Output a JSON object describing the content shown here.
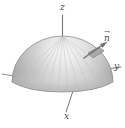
{
  "figure": {
    "name": "hemisphere-normal-vector-diagram",
    "background_color": "#ffffff"
  },
  "axes": {
    "z": {
      "label": "z",
      "description": "vertical axis rising from the apex of the dome"
    },
    "y": {
      "label": "y",
      "description": "axis extending to the right from the rim of the dome"
    },
    "x": {
      "label": "x",
      "description": "axis extending down and to the left toward the viewer"
    }
  },
  "annotations": {
    "normal_vector": {
      "label": "n",
      "accent": "→",
      "description": "outward unit normal vector arrow on a small surface patch of the upper right of the dome"
    }
  },
  "colors": {
    "background": "#ffffff",
    "surface_light": "#f2f2f2",
    "surface_mid": "#d8d8d8",
    "surface_dark": "#9a9a9a",
    "surface_shadow": "#868686",
    "outline": "#8a8a8a",
    "meridian": "#c4c4c4",
    "axis_line": "#777777",
    "patch_fill": "#a8a8a8",
    "arrow": "#6f6f6f",
    "label_text": "#4a4a4a"
  }
}
